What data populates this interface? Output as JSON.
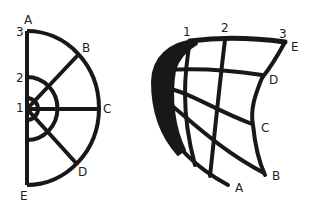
{
  "left_figure": {
    "description": "half-disc polar grid",
    "point_labels": {
      "A": "A",
      "B": "B",
      "C": "C",
      "D": "D",
      "E": "E"
    },
    "ring_labels": {
      "r1": "1",
      "r2": "2",
      "r3": "3"
    }
  },
  "right_figure": {
    "description": "distorted (warped) grid",
    "point_labels": {
      "A": "A",
      "B": "B",
      "C": "C",
      "D": "D",
      "E": "E"
    },
    "ring_labels": {
      "r1": "1",
      "r2": "2",
      "r3": "3"
    }
  },
  "colors": {
    "stroke": "#1a1718",
    "background": "#ffffff"
  }
}
